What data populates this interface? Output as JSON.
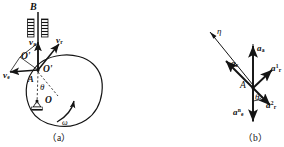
{
  "figure": {
    "kind": "mechanics-vector-diagram",
    "panels": [
      {
        "id": "a",
        "caption": "（a）",
        "title": "velocity composition"
      },
      {
        "id": "b",
        "caption": "（b）",
        "title": "acceleration composition"
      }
    ],
    "ink_color": "#141414",
    "paper_color": "#ffffff"
  },
  "panel_a": {
    "caption": "（a）",
    "labels": {
      "guide": "B",
      "v_absolute": "v",
      "v_absolute_sub": "a",
      "v_relative": "v",
      "v_relative_sub": "r",
      "v_transport": "v",
      "v_transport_sub": "e",
      "point_O_prime": "O'",
      "point_O_prime_alt": "O'",
      "point_A": "A",
      "point_O": "O",
      "angle_theta": "θ",
      "omega": "ω"
    }
  },
  "panel_b": {
    "caption": "（b）",
    "labels": {
      "eta_axis": "η",
      "a_absolute": "a",
      "a_absolute_sub": "a",
      "a_coriolis": "a",
      "a_coriolis_sub": "c",
      "a_r_one": "a",
      "a_r_one_sub": "r",
      "a_r_one_sup": "1",
      "a_r_two": "a",
      "a_r_two_sub": "r",
      "a_r_two_sup": "2",
      "a_e_n": "a",
      "a_e_n_sub": "e",
      "a_e_n_sup": "n",
      "point_A": "A",
      "angle_theta": "θ"
    }
  }
}
